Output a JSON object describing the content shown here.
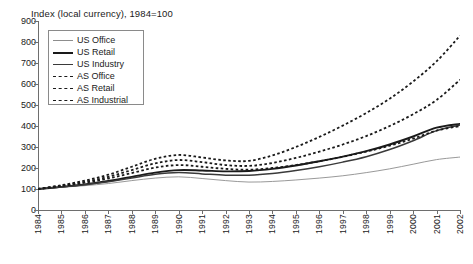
{
  "chart_data": {
    "type": "line",
    "title": "Index (local currency), 1984=100",
    "xlabel": "",
    "ylabel": "",
    "ylim": [
      0,
      900
    ],
    "ytick_step": 100,
    "yticks": [
      0,
      100,
      200,
      300,
      400,
      500,
      600,
      700,
      800,
      900
    ],
    "grid": false,
    "legend_position": "top-left",
    "x": [
      1984,
      1985,
      1986,
      1987,
      1988,
      1989,
      1990,
      1991,
      1992,
      1993,
      1994,
      1995,
      1996,
      1997,
      1998,
      1999,
      2000,
      2001
    ],
    "categories": [
      "1984",
      "1985",
      "1986",
      "1987",
      "1988",
      "1989",
      "1990",
      "1991",
      "1992",
      "1993",
      "1994",
      "1995",
      "1996",
      "1997",
      "1998",
      "1999",
      "2000",
      "2001",
      "2002"
    ],
    "series": [
      {
        "name": "US Office",
        "style": "solid-thin",
        "color": "#8d8d8d",
        "values": [
          100,
          108,
          116,
          126,
          140,
          152,
          158,
          150,
          140,
          133,
          136,
          143,
          152,
          163,
          178,
          196,
          218,
          240,
          252
        ]
      },
      {
        "name": "US Retail",
        "style": "solid-thick",
        "color": "#1a1a1a",
        "values": [
          100,
          110,
          122,
          138,
          158,
          178,
          190,
          188,
          184,
          186,
          196,
          212,
          232,
          254,
          280,
          312,
          350,
          392,
          410
        ]
      },
      {
        "name": "US Industry",
        "style": "solid-medium",
        "color": "#3a3a3a",
        "values": [
          100,
          110,
          120,
          134,
          152,
          170,
          178,
          172,
          166,
          166,
          174,
          188,
          206,
          228,
          254,
          288,
          330,
          378,
          405
        ]
      },
      {
        "name": "AS Office",
        "style": "dotted",
        "color": "#1a1a1a",
        "values": [
          100,
          118,
          140,
          168,
          206,
          244,
          262,
          250,
          236,
          234,
          260,
          300,
          348,
          402,
          462,
          530,
          612,
          708,
          830
        ]
      },
      {
        "name": "AS Retail",
        "style": "dotted",
        "color": "#1a1a1a",
        "values": [
          100,
          116,
          134,
          158,
          190,
          222,
          238,
          228,
          214,
          210,
          224,
          248,
          278,
          312,
          352,
          400,
          456,
          524,
          620
        ]
      },
      {
        "name": "AS Industrial",
        "style": "dotted",
        "color": "#1a1a1a",
        "values": [
          100,
          114,
          130,
          150,
          176,
          202,
          214,
          206,
          196,
          192,
          200,
          214,
          232,
          254,
          278,
          306,
          340,
          378,
          400
        ]
      }
    ]
  },
  "legend": {
    "items": [
      {
        "label": "US Office",
        "key": "sw-us-office"
      },
      {
        "label": "US Retail",
        "key": "sw-us-retail"
      },
      {
        "label": "US Industry",
        "key": "sw-us-industry"
      },
      {
        "label": "AS Office",
        "key": "sw-as-office"
      },
      {
        "label": "AS Retail",
        "key": "sw-as-retail"
      },
      {
        "label": "AS Industrial",
        "key": "sw-as-industrial"
      }
    ]
  },
  "caption": {
    "text": ""
  }
}
